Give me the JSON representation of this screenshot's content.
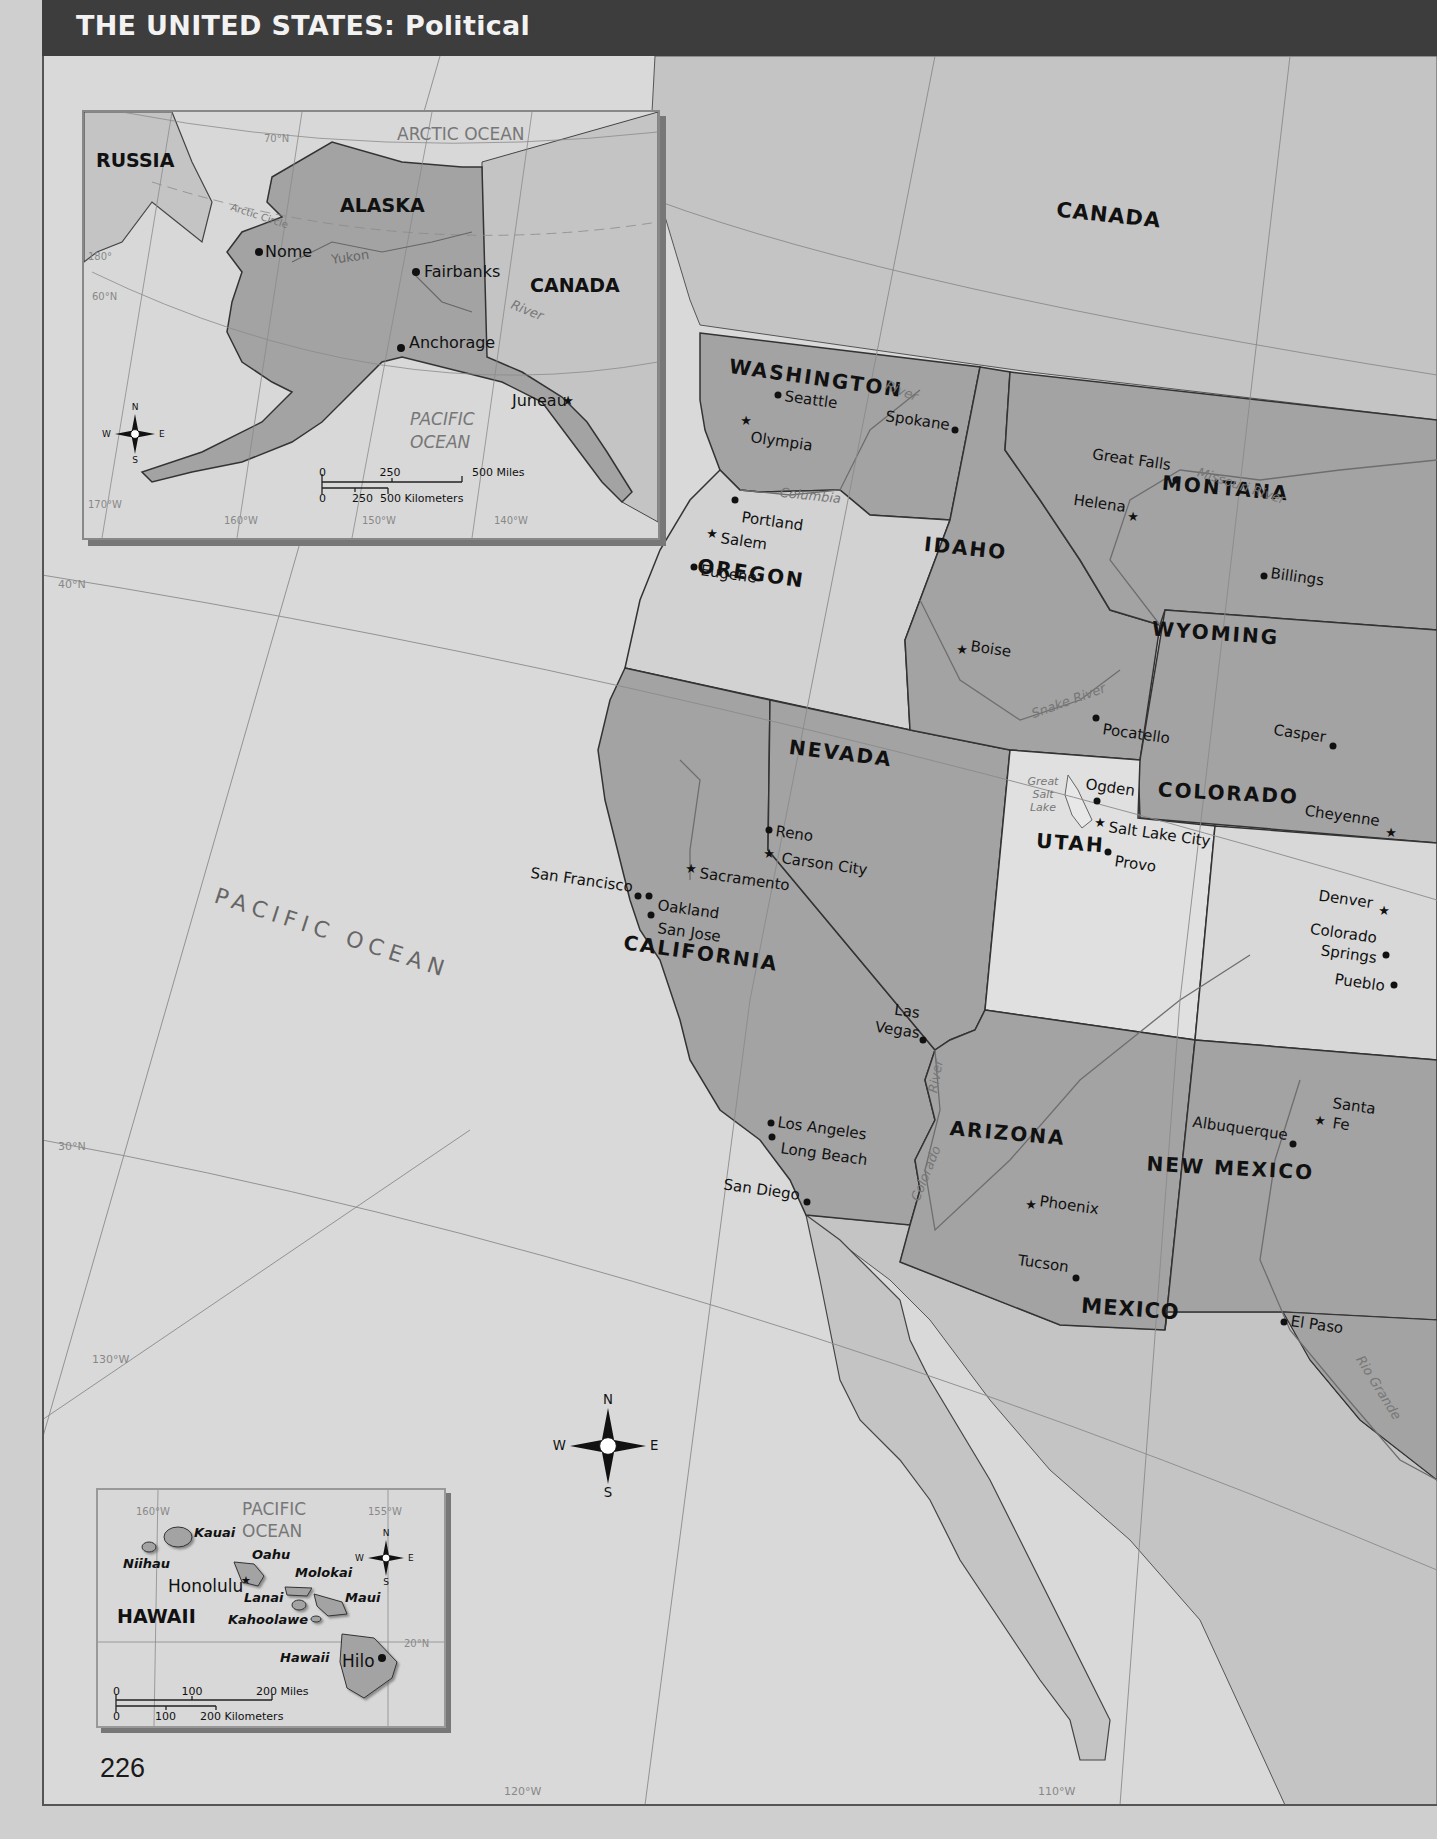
{
  "header": {
    "title": "THE UNITED STATES:",
    "subtitle": "Political"
  },
  "page_number": "226",
  "colors": {
    "title_bar": "#3d3d3d",
    "ocean": "#d9d9d9",
    "us_dark": "#a3a3a3",
    "us_light": "#d2d2d2",
    "foreign": "#bdbdbd",
    "border": "#333333",
    "graticule": "#8a8a8a",
    "water_label": "#777777"
  },
  "main_map": {
    "countries": [
      {
        "name": "CANADA",
        "x": 1108,
        "y": 222,
        "rot": 6
      },
      {
        "name": "MEXICO",
        "x": 1130,
        "y": 1316,
        "rot": 4
      }
    ],
    "ocean_label": {
      "name": "PACIFIC OCEAN",
      "x": 330,
      "y": 940,
      "rot": 18
    },
    "states": [
      {
        "name": "WASHINGTON",
        "x": 815,
        "y": 385,
        "rot": 8,
        "tone": "dark"
      },
      {
        "name": "OREGON",
        "x": 750,
        "y": 580,
        "rot": 8,
        "tone": "light"
      },
      {
        "name": "IDAHO",
        "x": 965,
        "y": 555,
        "rot": 6,
        "tone": "dark"
      },
      {
        "name": "MONTANA",
        "x": 1225,
        "y": 495,
        "rot": 5,
        "tone": "dark"
      },
      {
        "name": "WYOMING",
        "x": 1215,
        "y": 640,
        "rot": 4,
        "tone": "dark"
      },
      {
        "name": "NEVADA",
        "x": 840,
        "y": 760,
        "rot": 7,
        "tone": "dark"
      },
      {
        "name": "UTAH",
        "x": 1070,
        "y": 850,
        "rot": 4,
        "tone": "light"
      },
      {
        "name": "COLORADO",
        "x": 1228,
        "y": 800,
        "rot": 3,
        "tone": "light"
      },
      {
        "name": "CALIFORNIA",
        "x": 700,
        "y": 960,
        "rot": 8,
        "tone": "dark"
      },
      {
        "name": "ARIZONA",
        "x": 1007,
        "y": 1140,
        "rot": 5,
        "tone": "dark"
      },
      {
        "name": "NEW MEXICO",
        "x": 1230,
        "y": 1175,
        "rot": 3,
        "tone": "dark"
      }
    ],
    "cities": [
      {
        "name": "Seattle",
        "x": 778,
        "y": 395,
        "type": "city",
        "anchor": "start",
        "dx": 6,
        "dy": 6
      },
      {
        "name": "Olympia",
        "x": 746,
        "y": 420,
        "type": "capital",
        "anchor": "start",
        "dx": 4,
        "dy": 22
      },
      {
        "name": "Spokane",
        "x": 955,
        "y": 430,
        "type": "city",
        "anchor": "end",
        "dx": -6,
        "dy": 0
      },
      {
        "name": "Portland",
        "x": 735,
        "y": 500,
        "type": "city",
        "anchor": "start",
        "dx": 6,
        "dy": 22
      },
      {
        "name": "Salem",
        "x": 712,
        "y": 533,
        "type": "capital",
        "anchor": "start",
        "dx": 8,
        "dy": 10
      },
      {
        "name": "Eugene",
        "x": 694,
        "y": 567,
        "type": "city",
        "anchor": "start",
        "dx": 6,
        "dy": 8
      },
      {
        "name": "Great Falls",
        "x": 1176,
        "y": 480,
        "type": "city",
        "anchor": "end",
        "dx": -6,
        "dy": -10
      },
      {
        "name": "Helena",
        "x": 1133,
        "y": 516,
        "type": "capital",
        "anchor": "end",
        "dx": -8,
        "dy": -4
      },
      {
        "name": "Billings",
        "x": 1264,
        "y": 576,
        "type": "city",
        "anchor": "start",
        "dx": 6,
        "dy": 2
      },
      {
        "name": "Boise",
        "x": 962,
        "y": 649,
        "type": "capital",
        "anchor": "start",
        "dx": 8,
        "dy": 2
      },
      {
        "name": "Pocatello",
        "x": 1096,
        "y": 718,
        "type": "city",
        "anchor": "start",
        "dx": 6,
        "dy": 16
      },
      {
        "name": "Casper",
        "x": 1333,
        "y": 746,
        "type": "city",
        "anchor": "end",
        "dx": -8,
        "dy": -4
      },
      {
        "name": "Cheyenne",
        "x": 1391,
        "y": 832,
        "type": "capital",
        "anchor": "end",
        "dx": -12,
        "dy": -6
      },
      {
        "name": "Ogden",
        "x": 1097,
        "y": 801,
        "type": "city",
        "anchor": "start",
        "dx": -12,
        "dy": -12
      },
      {
        "name": "Salt Lake City",
        "x": 1100,
        "y": 822,
        "type": "capital",
        "anchor": "start",
        "dx": 8,
        "dy": 10
      },
      {
        "name": "Provo",
        "x": 1108,
        "y": 852,
        "type": "city",
        "anchor": "start",
        "dx": 6,
        "dy": 14
      },
      {
        "name": "Denver",
        "x": 1384,
        "y": 910,
        "type": "capital",
        "anchor": "end",
        "dx": -12,
        "dy": -2
      },
      {
        "name": "Colorado",
        "x": 1386,
        "y": 955,
        "type": "city",
        "anchor": "end",
        "dx": -10,
        "dy": -12
      },
      {
        "name": "Springs",
        "x": 1386,
        "y": 955,
        "type": "label",
        "anchor": "end",
        "dx": -10,
        "dy": 8
      },
      {
        "name": "Pueblo",
        "x": 1394,
        "y": 985,
        "type": "city",
        "anchor": "end",
        "dx": -10,
        "dy": 6
      },
      {
        "name": "Reno",
        "x": 769,
        "y": 830,
        "type": "city",
        "anchor": "start",
        "dx": 6,
        "dy": 6
      },
      {
        "name": "Carson City",
        "x": 769,
        "y": 853,
        "type": "capital",
        "anchor": "start",
        "dx": 12,
        "dy": 10
      },
      {
        "name": "Sacramento",
        "x": 691,
        "y": 868,
        "type": "capital",
        "anchor": "start",
        "dx": 8,
        "dy": 10
      },
      {
        "name": "San Francisco",
        "x": 638,
        "y": 896,
        "type": "city",
        "anchor": "end",
        "dx": -6,
        "dy": -4
      },
      {
        "name": "Oakland",
        "x": 649,
        "y": 896,
        "type": "city",
        "anchor": "start",
        "dx": 8,
        "dy": 14
      },
      {
        "name": "San Jose",
        "x": 651,
        "y": 915,
        "type": "city",
        "anchor": "start",
        "dx": 6,
        "dy": 18
      },
      {
        "name": "Las",
        "x": 923,
        "y": 1040,
        "type": "city",
        "anchor": "end",
        "dx": -4,
        "dy": -22
      },
      {
        "name": "Vegas",
        "x": 923,
        "y": 1040,
        "type": "label",
        "anchor": "end",
        "dx": -4,
        "dy": -2
      },
      {
        "name": "Los Angeles",
        "x": 771,
        "y": 1123,
        "type": "city",
        "anchor": "start",
        "dx": 6,
        "dy": 4
      },
      {
        "name": "Long Beach",
        "x": 772,
        "y": 1137,
        "type": "city",
        "anchor": "start",
        "dx": 8,
        "dy": 16
      },
      {
        "name": "San Diego",
        "x": 807,
        "y": 1202,
        "type": "city",
        "anchor": "end",
        "dx": -8,
        "dy": -2
      },
      {
        "name": "Phoenix",
        "x": 1031,
        "y": 1204,
        "type": "capital",
        "anchor": "start",
        "dx": 8,
        "dy": 2
      },
      {
        "name": "Tucson",
        "x": 1076,
        "y": 1278,
        "type": "city",
        "anchor": "end",
        "dx": -8,
        "dy": -6
      },
      {
        "name": "Albuquerque",
        "x": 1293,
        "y": 1144,
        "type": "city",
        "anchor": "end",
        "dx": -6,
        "dy": -4
      },
      {
        "name": "Santa",
        "x": 1320,
        "y": 1120,
        "type": "capital",
        "anchor": "start",
        "dx": 12,
        "dy": -12
      },
      {
        "name": "Fe",
        "x": 1320,
        "y": 1120,
        "type": "label",
        "anchor": "start",
        "dx": 12,
        "dy": 8
      },
      {
        "name": "El Paso",
        "x": 1284,
        "y": 1322,
        "type": "city",
        "anchor": "start",
        "dx": 6,
        "dy": 4
      }
    ],
    "rivers": [
      {
        "name": "River",
        "x": 900,
        "y": 395,
        "rot": 22
      },
      {
        "name": "Columbia",
        "x": 810,
        "y": 500,
        "rot": 6
      },
      {
        "name": "Missouri River",
        "x": 1240,
        "y": 490,
        "rot": 18
      },
      {
        "name": "Snake River",
        "x": 1070,
        "y": 705,
        "rot": -20
      },
      {
        "name": "River",
        "x": 940,
        "y": 1077,
        "rot": -80
      },
      {
        "name": "Colorado",
        "x": 930,
        "y": 1175,
        "rot": -68
      },
      {
        "name": "Rio Grande",
        "x": 1375,
        "y": 1390,
        "rot": 58
      }
    ],
    "lake": {
      "lines": [
        "Great",
        "Salt",
        "Lake"
      ],
      "x": 1043,
      "y": 785
    },
    "graticule_labels": [
      {
        "text": "40°N",
        "x": 58,
        "y": 588
      },
      {
        "text": "30°N",
        "x": 58,
        "y": 1150
      },
      {
        "text": "130°W",
        "x": 92,
        "y": 1363
      },
      {
        "text": "120°W",
        "x": 504,
        "y": 1795
      },
      {
        "text": "110°W",
        "x": 1038,
        "y": 1795
      }
    ],
    "compass": {
      "n": "N",
      "e": "E",
      "s": "S",
      "w": "W",
      "x": 608,
      "y": 1446
    }
  },
  "alaska_inset": {
    "labels": {
      "russia": "RUSSIA",
      "alaska": "ALASKA",
      "canada": "CANADA",
      "arctic_ocean": "ARCTIC OCEAN",
      "pacific_1": "PACIFIC",
      "pacific_2": "OCEAN",
      "arctic_circle": "Arctic Circle",
      "yukon": "Yukon",
      "river": "River"
    },
    "cities": [
      {
        "name": "Nome",
        "x": 257,
        "y": 250,
        "type": "city"
      },
      {
        "name": "Fairbanks",
        "x": 414,
        "y": 270,
        "type": "city"
      },
      {
        "name": "Anchorage",
        "x": 399,
        "y": 346,
        "type": "city"
      },
      {
        "name": "Juneau",
        "x": 566,
        "y": 398,
        "type": "capital"
      }
    ],
    "graticule_labels": [
      "70°N",
      "180°",
      "60°N",
      "170°W",
      "160°W",
      "150°W",
      "140°W"
    ],
    "scale": {
      "miles": [
        "0",
        "250",
        "500 Miles"
      ],
      "km": [
        "0",
        "250",
        "500 Kilometers"
      ]
    }
  },
  "hawaii_inset": {
    "labels": {
      "state": "HAWAII",
      "ocean_1": "PACIFIC",
      "ocean_2": "OCEAN"
    },
    "islands": [
      "Kauai",
      "Niihau",
      "Oahu",
      "Molokai",
      "Lanai",
      "Maui",
      "Kahoolawe",
      "Hawaii"
    ],
    "cities": [
      {
        "name": "Honolulu",
        "type": "capital"
      },
      {
        "name": "Hilo",
        "type": "city"
      }
    ],
    "graticule_labels": [
      "160°W",
      "155°W",
      "20°N"
    ],
    "scale": {
      "miles": [
        "0",
        "100",
        "200 Miles"
      ],
      "km": [
        "0",
        "100",
        "200 Kilometers"
      ]
    },
    "compass": {
      "n": "N",
      "e": "E",
      "s": "S",
      "w": "W"
    }
  }
}
